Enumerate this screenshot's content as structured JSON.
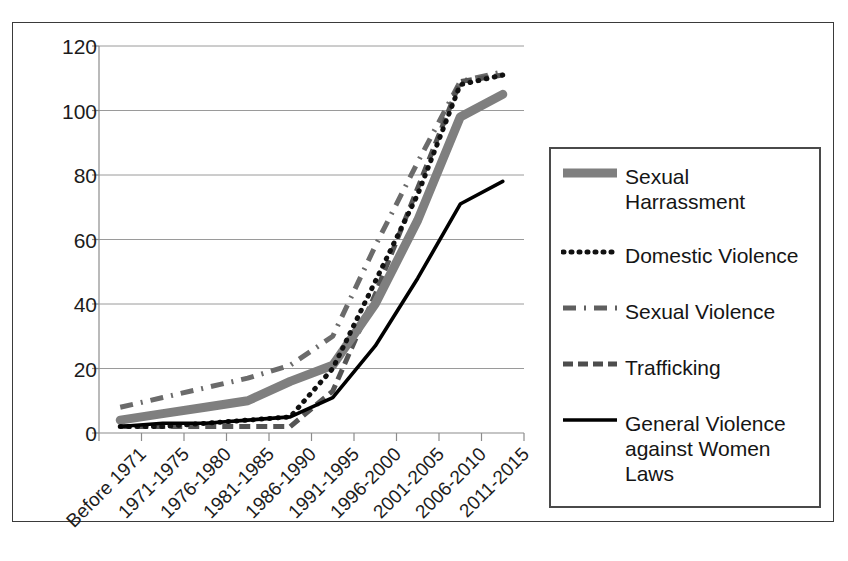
{
  "chart_data": {
    "type": "line",
    "title": "",
    "xlabel": "",
    "ylabel": "",
    "ylim": [
      0,
      120
    ],
    "yticks": [
      0,
      20,
      40,
      60,
      80,
      100,
      120
    ],
    "grid": true,
    "legend_position": "right",
    "categories": [
      "Before 1971",
      "1971-1975",
      "1976-1980",
      "1981-1985",
      "1986-1990",
      "1991-1995",
      "1996-2000",
      "2001-2005",
      "2006-2010",
      "2011-2015"
    ],
    "series": [
      {
        "name": "Sexual Harrassment",
        "style": "thick-solid",
        "color": "#7f7f7f",
        "values": [
          4,
          6,
          8,
          10,
          16,
          21,
          40,
          66,
          98,
          105
        ]
      },
      {
        "name": "Domestic Violence",
        "style": "dotted",
        "color": "#111111",
        "values": [
          2,
          2,
          3,
          4,
          5,
          20,
          47,
          74,
          108,
          111
        ]
      },
      {
        "name": "Sexual Violence",
        "style": "dash-dot",
        "color": "#6b6b6b",
        "values": [
          8,
          11,
          14,
          17,
          21,
          30,
          58,
          84,
          109,
          112
        ]
      },
      {
        "name": "Trafficking",
        "style": "dashed",
        "color": "#555555",
        "values": [
          2,
          2,
          2,
          2,
          2,
          13,
          43,
          76,
          109,
          111
        ]
      },
      {
        "name": "General Violence against Women Laws",
        "style": "thin-solid",
        "color": "#000000",
        "values": [
          2,
          3,
          3,
          4,
          5,
          11,
          27,
          48,
          71,
          78
        ]
      }
    ]
  },
  "legend": {
    "items": [
      {
        "label": "Sexual Harrassment",
        "swatch": "thick-solid-gray"
      },
      {
        "label": "Domestic Violence",
        "swatch": "dotted-black"
      },
      {
        "label": "Sexual Violence",
        "swatch": "dash-dot-gray"
      },
      {
        "label": "Trafficking",
        "swatch": "dashed-gray"
      },
      {
        "label": "General Violence against Women Laws",
        "swatch": "thin-solid-black"
      }
    ]
  }
}
